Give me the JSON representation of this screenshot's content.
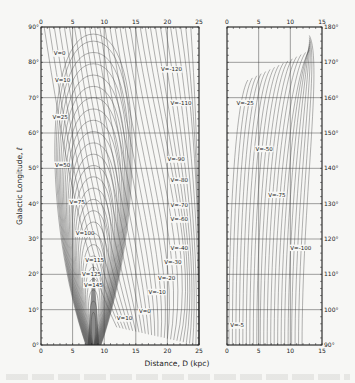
{
  "chart_data": [
    {
      "type": "line",
      "panel": "left",
      "title": "",
      "xlabel": "Distance, D (kpc)",
      "ylabel": "Galactic Longitude, ℓ",
      "xlim": [
        0,
        25
      ],
      "ylim": [
        0,
        90
      ],
      "x_ticks": [
        "0",
        "5",
        "10",
        "15",
        "20",
        "25"
      ],
      "y_ticks": [
        "0°",
        "10°",
        "20°",
        "30°",
        "40°",
        "50°",
        "60°",
        "70°",
        "80°",
        "90°"
      ],
      "grid": true,
      "contour_labels": [
        {
          "text": "V=0",
          "D": 2.0,
          "l": 82
        },
        {
          "text": "V=10",
          "D": 2.2,
          "l": 74.5
        },
        {
          "text": "V=25",
          "D": 1.8,
          "l": 64
        },
        {
          "text": "V=50",
          "D": 2.2,
          "l": 50.5
        },
        {
          "text": "V=75",
          "D": 4.5,
          "l": 40
        },
        {
          "text": "V=100",
          "D": 5.5,
          "l": 31
        },
        {
          "text": "V=115",
          "D": 7.0,
          "l": 23.5
        },
        {
          "text": "V=125",
          "D": 6.5,
          "l": 19.5
        },
        {
          "text": "V=145",
          "D": 6.8,
          "l": 16.5
        },
        {
          "text": "V=10",
          "D": 12.0,
          "l": 7
        },
        {
          "text": "V=0",
          "D": 15.5,
          "l": 9
        },
        {
          "text": "V=-10",
          "D": 17.0,
          "l": 14.5
        },
        {
          "text": "V=-20",
          "D": 18.5,
          "l": 18.5
        },
        {
          "text": "V=-30",
          "D": 19.5,
          "l": 23
        },
        {
          "text": "V=-40",
          "D": 20.5,
          "l": 27
        },
        {
          "text": "V=-60",
          "D": 20.5,
          "l": 35
        },
        {
          "text": "V=-70",
          "D": 20.5,
          "l": 39
        },
        {
          "text": "V=-80",
          "D": 20.5,
          "l": 46
        },
        {
          "text": "V=-90",
          "D": 20.0,
          "l": 52
        },
        {
          "text": "V=-110",
          "D": 20.5,
          "l": 68
        },
        {
          "text": "V=-120",
          "D": 19.0,
          "l": 77.5
        }
      ]
    },
    {
      "type": "line",
      "panel": "right",
      "xlabel": "Distance, D (kpc)",
      "ylabel": "Galactic Longitude, ℓ",
      "xlim": [
        0,
        15
      ],
      "ylim": [
        90,
        180
      ],
      "x_ticks": [
        "0",
        "5",
        "10",
        "15"
      ],
      "y_ticks": [
        "90°",
        "100°",
        "110°",
        "120°",
        "130°",
        "140°",
        "150°",
        "160°",
        "170°",
        "180°"
      ],
      "grid": true,
      "contour_labels": [
        {
          "text": "V=-5",
          "D": 0.5,
          "l": 95
        },
        {
          "text": "V=-25",
          "D": 1.5,
          "l": 158
        },
        {
          "text": "V=-50",
          "D": 4.5,
          "l": 145
        },
        {
          "text": "V=-75",
          "D": 6.5,
          "l": 132
        },
        {
          "text": "V=-100",
          "D": 10.0,
          "l": 117
        }
      ]
    }
  ],
  "figure": {
    "xlabel": "Distance, D (kpc)",
    "ylabel": "Galactic Longitude, ℓ"
  },
  "colors": {
    "background": "#f7f7f5",
    "ink": "#222222",
    "grid": "#444444",
    "contour": "#555555"
  }
}
